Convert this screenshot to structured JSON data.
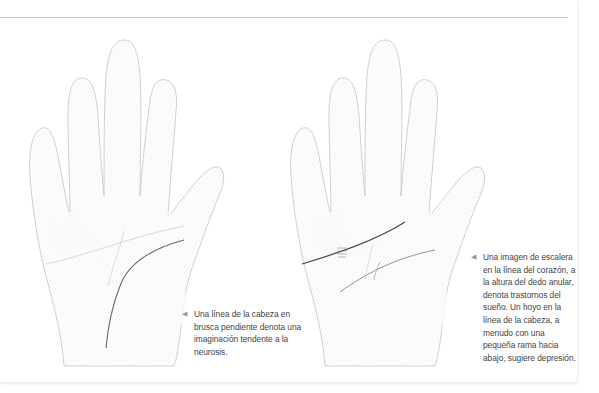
{
  "figures": [
    {
      "id": "left",
      "illustration": "palm-drawing-sloping-head-line",
      "line_color": "#6b6b6b",
      "caption": {
        "arrow_icon": "◀",
        "text": "Una línea de la cabeza en brusca pendiente denota una imaginación tendente a la neurosis."
      }
    },
    {
      "id": "right",
      "illustration": "palm-drawing-ladder-heart-line-head-line-hole",
      "line_color": "#4a4a4a",
      "caption": {
        "arrow_icon": "◀",
        "text": "Una imagen de escalera en la línea del corazón, a la altura del dedo anular, denota trastornos del sueño. Un hoyo en la línea de la cabeza, a menudo con una pequeña rama hacia abajo, sugiere depresión."
      }
    }
  ],
  "colors": {
    "rule": "#c8c8c8",
    "caption_text": "#444444",
    "arrow": "#9a9a9a",
    "sketch_stroke": "#b5b5b5"
  }
}
